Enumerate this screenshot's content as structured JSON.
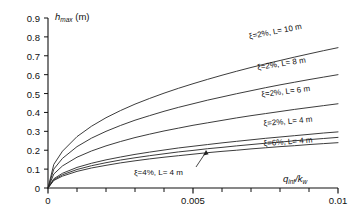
{
  "chart_data": {
    "type": "line",
    "title": "",
    "xlabel": "q_inf/k_w",
    "ylabel": "h_max (m)",
    "xlim": [
      0,
      0.01
    ],
    "ylim": [
      0,
      0.9
    ],
    "grid": false,
    "legend_position": "inline-on-curves",
    "x_ticks": [
      0,
      0.001,
      0.002,
      0.003,
      0.004,
      0.005,
      0.006,
      0.007,
      0.008,
      0.009,
      0.01
    ],
    "x_tick_labels": [
      "0",
      "",
      "",
      "",
      "",
      "0.005",
      "",
      "",
      "",
      "",
      "0.01"
    ],
    "y_ticks": [
      0,
      0.1,
      0.2,
      0.3,
      0.4,
      0.5,
      0.6,
      0.7,
      0.8,
      0.9
    ],
    "y_tick_labels": [
      "0",
      "0.1",
      "0.2",
      "0.3",
      "0.4",
      "0.5",
      "0.6",
      "0.7",
      "0.8",
      "0.9"
    ],
    "x": [
      0,
      0.0002,
      0.0005,
      0.001,
      0.0015,
      0.002,
      0.0025,
      0.003,
      0.0035,
      0.004,
      0.0045,
      0.005,
      0.0055,
      0.006,
      0.0065,
      0.007,
      0.0075,
      0.008,
      0.0085,
      0.009,
      0.0095,
      0.01
    ],
    "series": [
      {
        "name": "xi=2%, L= 10 m",
        "damping": "2%",
        "length_m": 10,
        "values": [
          0,
          0.125,
          0.195,
          0.272,
          0.327,
          0.372,
          0.41,
          0.444,
          0.474,
          0.502,
          0.528,
          0.552,
          0.575,
          0.597,
          0.618,
          0.638,
          0.657,
          0.675,
          0.693,
          0.71,
          0.727,
          0.743
        ]
      },
      {
        "name": "xi=2%, L= 8 m",
        "damping": "2%",
        "length_m": 8,
        "values": [
          0,
          0.1,
          0.157,
          0.219,
          0.264,
          0.3,
          0.331,
          0.359,
          0.383,
          0.406,
          0.427,
          0.446,
          0.465,
          0.482,
          0.499,
          0.515,
          0.531,
          0.546,
          0.56,
          0.574,
          0.587,
          0.6
        ]
      },
      {
        "name": "xi=2%, L= 6 m",
        "damping": "2%",
        "length_m": 6,
        "values": [
          0,
          0.074,
          0.117,
          0.163,
          0.196,
          0.223,
          0.246,
          0.267,
          0.285,
          0.302,
          0.317,
          0.332,
          0.345,
          0.358,
          0.371,
          0.383,
          0.394,
          0.405,
          0.416,
          0.426,
          0.436,
          0.446
        ]
      },
      {
        "name": "xi=2%, L= 4 m",
        "damping": "2%",
        "length_m": 4,
        "values": [
          0,
          0.049,
          0.078,
          0.109,
          0.131,
          0.149,
          0.164,
          0.178,
          0.19,
          0.201,
          0.212,
          0.221,
          0.23,
          0.239,
          0.247,
          0.255,
          0.263,
          0.27,
          0.277,
          0.284,
          0.291,
          0.297
        ]
      },
      {
        "name": "xi=4%, L= 4 m",
        "damping": "4%",
        "length_m": 4,
        "values": [
          0,
          0.044,
          0.07,
          0.098,
          0.118,
          0.134,
          0.148,
          0.16,
          0.171,
          0.181,
          0.191,
          0.199,
          0.208,
          0.215,
          0.223,
          0.23,
          0.237,
          0.243,
          0.25,
          0.256,
          0.262,
          0.268
        ]
      },
      {
        "name": "xi=6%, L= 4 m",
        "damping": "6%",
        "length_m": 4,
        "values": [
          0,
          0.04,
          0.063,
          0.088,
          0.106,
          0.12,
          0.133,
          0.144,
          0.154,
          0.163,
          0.171,
          0.179,
          0.187,
          0.194,
          0.2,
          0.207,
          0.213,
          0.219,
          0.224,
          0.23,
          0.235,
          0.24
        ]
      }
    ],
    "annotations": [
      {
        "text": "ξ=4%, L= 4 m",
        "points_to_series": "xi=4%, L= 4 m",
        "has_arrow": true
      }
    ],
    "colors": {
      "line": "#262626",
      "axis": "#111111",
      "background": "#ffffff"
    }
  },
  "labels": {
    "y_axis_title_main": "h",
    "y_axis_title_sub": "max",
    "y_axis_title_unit": " (m)",
    "x_axis_title_main": "q",
    "x_axis_title_sub": "inf",
    "x_axis_title_div": "/k",
    "x_axis_title_sub2": "w",
    "curve_labels": [
      "ξ=2%, L= 10 m",
      "ξ=2%, L= 8 m",
      "ξ=2%, L= 6 m",
      "ξ=2%, L= 4 m",
      "ξ=6%, L= 4 m"
    ],
    "annotation_label": "ξ=4%, L= 4 m",
    "ytick_0": "0",
    "ytick_1": "0.1",
    "ytick_2": "0.2",
    "ytick_3": "0.3",
    "ytick_4": "0.4",
    "ytick_5": "0.5",
    "ytick_6": "0.6",
    "ytick_7": "0.7",
    "ytick_8": "0.8",
    "ytick_9": "0.9",
    "xtick_0": "0",
    "xtick_1": "0.005",
    "xtick_2": "0.01"
  }
}
